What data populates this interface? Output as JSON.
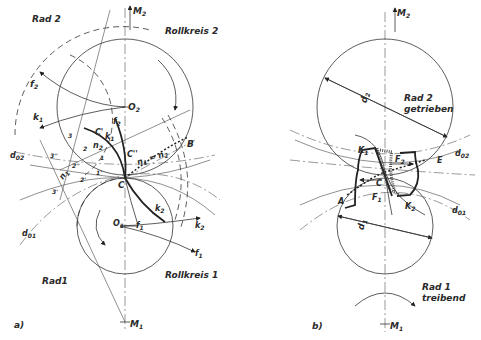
{
  "figure_a": {
    "caption": "a)",
    "labels": {
      "rad2": "Rad 2",
      "rad1": "Rad1",
      "rollkreis2": "Rollkreis 2",
      "rollkreis1": "Rollkreis 1",
      "M2": "M",
      "M2_sub": "2",
      "M1": "M",
      "M1_sub": "1",
      "O2": "O",
      "O2_sub": "2",
      "O1": "O",
      "O1_sub": "1",
      "f2": "f",
      "f2_sub": "2",
      "f2b": "f",
      "f2b_sub": "2",
      "f1": "f",
      "f1_sub": "1",
      "f1b": "f",
      "f1b_sub": "1",
      "k1": "k",
      "k1_sub": "1",
      "k1b": "k",
      "k1b_sub": "1",
      "k2": "k",
      "k2_sub": "2",
      "k2b": "k",
      "k2b_sub": "2",
      "d02": "d",
      "d02_sub": "02",
      "d01": "d",
      "d01_sub": "01",
      "n1": "n",
      "n1_sub": "1",
      "n2": "n",
      "n2_sub": "2",
      "n1eqn2": "n",
      "n1eqn2_mid": "1",
      "n1eqn2_tail": " = n",
      "n1eqn2_sub2": "2",
      "C": "C",
      "C1": "C'",
      "C2": "C''",
      "B": "B",
      "p3": "3",
      "p2": "2",
      "p1": "1",
      "p3p": "3'",
      "p2p": "2'",
      "p1p": "1'",
      "p3pp": "3''",
      "p2pp": "2''"
    }
  },
  "figure_b": {
    "caption": "b)",
    "labels": {
      "rad2": "Rad 2",
      "getrieben": "getrieben",
      "rad1": "Rad 1",
      "treibend": "treibend",
      "M2": "M",
      "M2_sub": "2",
      "M1": "M",
      "M1_sub": "1",
      "d2": "d",
      "d2_sub": "2",
      "d1": "d",
      "d1_sub": "1",
      "d02": "d",
      "d02_sub": "02",
      "d01": "d",
      "d01_sub": "01",
      "K1": "K",
      "K1_sub": "1",
      "K2": "K",
      "K2_sub": "2",
      "F2": "F",
      "F2_sub": "2",
      "F1": "F",
      "F1_sub": "1",
      "C": "C",
      "A": "A",
      "E": "E"
    }
  }
}
